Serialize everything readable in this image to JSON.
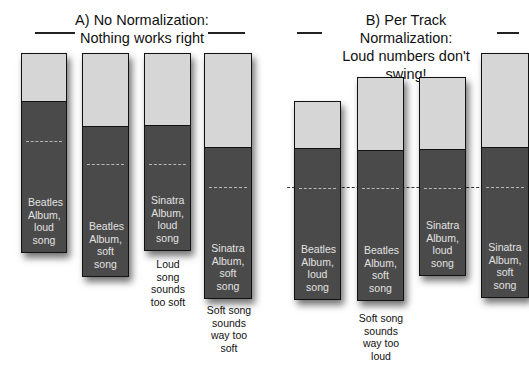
{
  "panels": [
    {
      "id": "A",
      "title_line1": "A) No Normalization:",
      "title_line2": "Nothing works right",
      "bars": [
        {
          "label": "Beatles Album, loud song",
          "note": ""
        },
        {
          "label": "Beatles Album, soft song",
          "note": ""
        },
        {
          "label": "Sinatra Album, loud song",
          "note": "Loud song sounds too soft"
        },
        {
          "label": "Sinatra Album, soft song",
          "note": "Soft song sounds way too soft"
        }
      ]
    },
    {
      "id": "B",
      "title_line1": "B) Per Track Normalization:",
      "title_line2": "Loud numbers don't swing!",
      "bars": [
        {
          "label": "Beatles Album, loud song",
          "note": ""
        },
        {
          "label": "Beatles Album, soft song",
          "note": "Soft song sounds way too loud"
        },
        {
          "label": "Sinatra Album, loud song",
          "note": ""
        },
        {
          "label": "Sinatra Album, soft song",
          "note": ""
        }
      ]
    }
  ],
  "colors": {
    "headroom": "#d6d6d6",
    "signal": "#4a4a4a",
    "dash": "#b8b8b8",
    "text_dark": "#111111",
    "text_light": "#e2e2e2"
  }
}
